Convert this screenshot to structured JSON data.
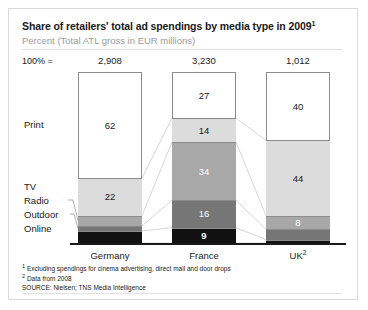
{
  "chart_data": {
    "type": "bar",
    "title": "Share of retailers' total ad spendings by media type in 2009",
    "title_superscript": "1",
    "subtitle": "Percent (Total ATL gross in EUR millions)",
    "total_axis_label": "100% =",
    "categories": [
      "Germany",
      "France",
      "UK"
    ],
    "category_superscripts": [
      "",
      "",
      "2"
    ],
    "totals": [
      "2,908",
      "3,230",
      "1,012"
    ],
    "series": [
      {
        "name": "Print",
        "values": [
          62,
          27,
          40
        ],
        "color": "#ffffff"
      },
      {
        "name": "TV",
        "values": [
          22,
          14,
          44
        ],
        "color": "#dcdcdc"
      },
      {
        "name": "Radio",
        "values": [
          6,
          34,
          8
        ],
        "color": "#a8a8a8"
      },
      {
        "name": "Outdoor",
        "values": [
          3,
          16,
          6
        ],
        "color": "#767676"
      },
      {
        "name": "Online",
        "values": [
          7,
          9,
          2
        ],
        "color": "#111111"
      }
    ],
    "ylim": [
      0,
      100
    ],
    "ylabel": "",
    "xlabel": "",
    "grid": false,
    "legend_position": "left-axis-labels",
    "stacked": true,
    "connectors": true
  },
  "footnotes": {
    "note1_marker": "1",
    "note1": "Excluding spendings for cinema advertising, direct mail and door drops",
    "note2_marker": "2",
    "note2": "Data from 2008",
    "source": "SOURCE: Nielsen; TNS Media Intelligence"
  },
  "colors": {
    "text": "#1a1a1a",
    "subtitle": "#9b9b9b",
    "frame": "#d9d9d9",
    "connector": "#cccccc"
  }
}
